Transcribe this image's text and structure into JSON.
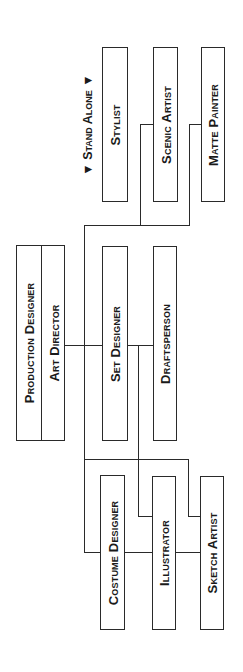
{
  "diagram": {
    "type": "org-chart",
    "orientation": "rotated-90-ccw",
    "stand_alone_label": "▼ Stand Alone ▼",
    "top": {
      "line1": "Production Designer",
      "line2": "Art Director"
    },
    "nodes": {
      "stylist": "Stylist",
      "scenic_artist": "Scenic Artist",
      "matte_painter": "Matte Painter",
      "set_designer": "Set Designer",
      "draftsperson": "Draftsperson",
      "costume_designer": "Costume Designer",
      "illustrator": "Illustrator",
      "sketch_artist": "Sketch Artist"
    },
    "edges": [
      [
        "Art Director",
        "Set Designer"
      ],
      [
        "Set Designer",
        "Draftsperson"
      ],
      [
        "Art Director",
        "Scenic Artist"
      ],
      [
        "Art Director",
        "Matte Painter"
      ],
      [
        "Art Director",
        "Costume Designer"
      ],
      [
        "Art Director",
        "Illustrator"
      ],
      [
        "Art Director",
        "Sketch Artist"
      ]
    ]
  }
}
